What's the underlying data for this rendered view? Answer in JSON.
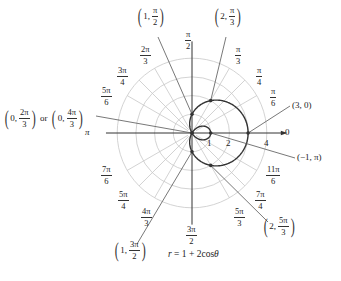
{
  "figure": {
    "equation": "r = 1 + 2cosθ",
    "equation_parts": {
      "lhs": "r",
      "rhs": " = 1 + 2cos",
      "theta": "θ"
    },
    "center_px": [
      192,
      133
    ],
    "unit_px": 18.7,
    "ring_radii": [
      1,
      2,
      3,
      4
    ],
    "colors": {
      "grid": "#c8c8c8",
      "axis": "#333333",
      "curve": "#333333",
      "leader": "#555555",
      "text": "#222222"
    }
  },
  "axis_labels": {
    "zero": "0",
    "pi": "π"
  },
  "radius_labels": [
    {
      "value": "1",
      "x": 207,
      "y": 140
    },
    {
      "value": "2",
      "x": 226,
      "y": 140
    },
    {
      "value": "4",
      "x": 264,
      "y": 140
    }
  ],
  "angle_labels": [
    {
      "id": "pi_over_2",
      "num": "π",
      "den": "2",
      "x": 185,
      "y": 30
    },
    {
      "id": "pi_over_3",
      "num": "π",
      "den": "3",
      "x": 235,
      "y": 45
    },
    {
      "id": "pi_over_4",
      "num": "π",
      "den": "4",
      "x": 256,
      "y": 66
    },
    {
      "id": "pi_over_6",
      "num": "π",
      "den": "6",
      "x": 270,
      "y": 87
    },
    {
      "id": "2pi_over_3",
      "num": "2π",
      "den": "3",
      "x": 140,
      "y": 45
    },
    {
      "id": "3pi_over_4",
      "num": "3π",
      "den": "4",
      "x": 117,
      "y": 66
    },
    {
      "id": "5pi_over_6",
      "num": "5π",
      "den": "6",
      "x": 101,
      "y": 86
    },
    {
      "id": "7pi_over_6",
      "num": "7π",
      "den": "6",
      "x": 101,
      "y": 165
    },
    {
      "id": "5pi_over_4",
      "num": "5π",
      "den": "4",
      "x": 118,
      "y": 190
    },
    {
      "id": "4pi_over_3",
      "num": "4π",
      "den": "3",
      "x": 141,
      "y": 207
    },
    {
      "id": "3pi_over_2",
      "num": "3π",
      "den": "2",
      "x": 186,
      "y": 225
    },
    {
      "id": "5pi_over_3",
      "num": "5π",
      "den": "3",
      "x": 234,
      "y": 207
    },
    {
      "id": "7pi_over_4",
      "num": "7π",
      "den": "4",
      "x": 255,
      "y": 190
    },
    {
      "id": "11pi_over_6",
      "num": "11π",
      "den": "6",
      "x": 266,
      "y": 165
    }
  ],
  "points": [
    {
      "id": "p_1_pi2",
      "label_r": "1",
      "label_theta_num": "π",
      "label_theta_den": "2",
      "text": "(1, π/2)",
      "r": 1,
      "theta_deg": 90,
      "label_x": 143,
      "label_y": 9
    },
    {
      "id": "p_2_pi3",
      "label_r": "2",
      "label_theta_num": "π",
      "label_theta_den": "3",
      "text": "(2, π/3)",
      "r": 2,
      "theta_deg": 60,
      "label_x": 218,
      "label_y": 9
    },
    {
      "id": "p_3_0",
      "text": "(3, 0)",
      "r": 3,
      "theta_deg": 0,
      "label_x": 292,
      "label_y": 102
    },
    {
      "id": "p_m1_pi",
      "text": "(−1, π)",
      "r": -1,
      "theta_deg": 180,
      "label_x": 297,
      "label_y": 155
    },
    {
      "id": "p_2_5pi3",
      "label_r": "2",
      "label_theta_num": "5π",
      "label_theta_den": "3",
      "text": "(2, 5π/3)",
      "r": 2,
      "theta_deg": 300,
      "label_x": 268,
      "label_y": 221
    },
    {
      "id": "p_1_3pi2",
      "label_r": "1",
      "label_theta_num": "3π",
      "label_theta_den": "2",
      "text": "(1, 3π/2)",
      "r": 1,
      "theta_deg": 270,
      "label_x": 113,
      "label_y": 243
    },
    {
      "id": "p_0_2pi3",
      "text": "(0, 2π/3) or (0, 4π/3)",
      "parts": {
        "a_r": "0",
        "a_num": "2π",
        "a_den": "3",
        "or": "or",
        "b_r": "0",
        "b_num": "4π",
        "b_den": "3"
      },
      "r": 0,
      "theta_deg": 120,
      "label_x": 4,
      "label_y": 112
    }
  ]
}
